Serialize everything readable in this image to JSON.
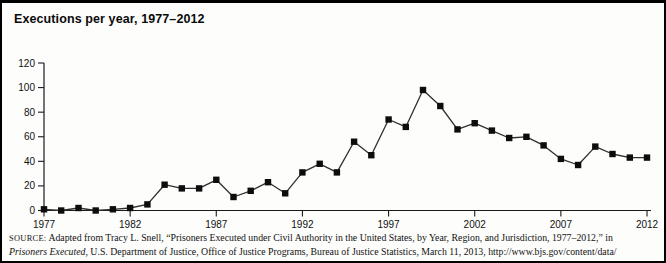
{
  "title": "Executions per year, 1977–2012",
  "chart_data": {
    "type": "line",
    "title": "Executions per year, 1977–2012",
    "xlabel": "",
    "ylabel": "",
    "grid": false,
    "legend": null,
    "marker": "square",
    "line_color": "#2f2f2f",
    "marker_color": "#0d0d0d",
    "axis_color": "#1a1a1a",
    "ylim": [
      0,
      120
    ],
    "yticks": [
      0,
      20,
      40,
      60,
      80,
      100,
      120
    ],
    "xticks": [
      1977,
      1982,
      1987,
      1992,
      1997,
      2002,
      2007,
      2012
    ],
    "years": [
      1977,
      1978,
      1979,
      1980,
      1981,
      1982,
      1983,
      1984,
      1985,
      1986,
      1987,
      1988,
      1989,
      1990,
      1991,
      1992,
      1993,
      1994,
      1995,
      1996,
      1997,
      1998,
      1999,
      2000,
      2001,
      2002,
      2003,
      2004,
      2005,
      2006,
      2007,
      2008,
      2009,
      2010,
      2011,
      2012
    ],
    "values": [
      1,
      0,
      2,
      0,
      1,
      2,
      5,
      21,
      18,
      18,
      25,
      11,
      16,
      23,
      14,
      31,
      38,
      31,
      56,
      45,
      74,
      68,
      98,
      85,
      66,
      71,
      65,
      59,
      60,
      53,
      42,
      37,
      52,
      46,
      43,
      43
    ]
  },
  "source": {
    "label": "SOURCE:",
    "line1": "Adapted from Tracy L. Snell, “Prisoners Executed under Civil Authority in the United States, by Year, Region, and Jurisdiction, 1977–2012,” in",
    "work_title": "Prisoners Executed",
    "line2": ", U.S. Department of Justice, Office of Justice Programs, Bureau of Justice Statistics, March 11, 2013, http://www.bjs.gov/content/data/"
  },
  "colors": {
    "background": "#fdfdfc",
    "frame_border": "#000000"
  }
}
